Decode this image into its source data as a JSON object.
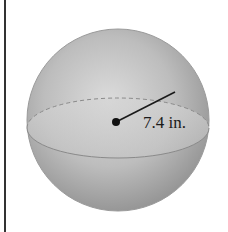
{
  "figure": {
    "shape": "sphere",
    "radius_label": "7.4 in.",
    "radius_value": 7.4,
    "unit": "in.",
    "colors": {
      "sphere_light": "#d9d9d9",
      "sphere_mid": "#b3b3b3",
      "sphere_dark": "#8c8c8c",
      "line": "#1a1a1a",
      "border": "#333333"
    }
  }
}
